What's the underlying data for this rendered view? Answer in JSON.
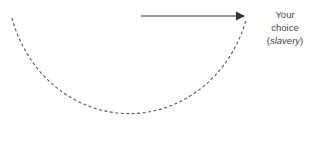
{
  "diagram": {
    "label": {
      "line1": "Your",
      "line2": "choice",
      "line3_open": "(",
      "line3_italic": "slavery",
      "line3_close": ")"
    },
    "bottom_text_cropped": "",
    "colors": {
      "stroke": "#555555",
      "arrow": "#333333",
      "text": "#444444"
    }
  }
}
